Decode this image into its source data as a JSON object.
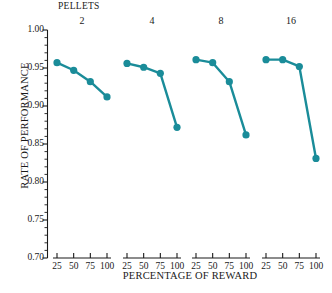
{
  "chart_data": {
    "type": "line",
    "title": "PELLETS",
    "xlabel": "PERCENTAGE OF REWARD",
    "ylabel": "RATE OF PERFORMANCE",
    "ylim": [
      0.7,
      1.0
    ],
    "ytick_labels": [
      "1.00",
      "0.95",
      "0.90",
      "0.85",
      "0.80",
      "0.75",
      "0.70"
    ],
    "ytick_values": [
      1.0,
      0.95,
      0.9,
      0.85,
      0.8,
      0.75,
      0.7
    ],
    "yminor_step": 0.01,
    "grid": false,
    "legend": "none",
    "marker": "filled-circle",
    "color": "#1a8c99",
    "categories": [
      25,
      50,
      75,
      100
    ],
    "xtick_labels": [
      "25",
      "50",
      "75",
      "100"
    ],
    "panels": [
      {
        "label": "2",
        "x": [
          25,
          50,
          75,
          100
        ],
        "values": [
          0.957,
          0.947,
          0.932,
          0.912
        ]
      },
      {
        "label": "4",
        "x": [
          25,
          50,
          75,
          100
        ],
        "values": [
          0.956,
          0.951,
          0.943,
          0.872
        ]
      },
      {
        "label": "8",
        "x": [
          25,
          50,
          75,
          100
        ],
        "values": [
          0.961,
          0.957,
          0.932,
          0.862
        ]
      },
      {
        "label": "16",
        "x": [
          25,
          50,
          75,
          100
        ],
        "values": [
          0.961,
          0.961,
          0.952,
          0.831
        ]
      }
    ]
  }
}
